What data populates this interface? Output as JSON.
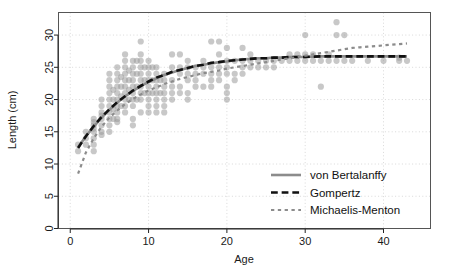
{
  "chart_data": {
    "type": "scatter",
    "title": "",
    "xlabel": "Age",
    "ylabel": "Length (cm)",
    "xlim": [
      -1.5,
      46
    ],
    "ylim": [
      0,
      33.5
    ],
    "xticks": [
      0,
      10,
      20,
      30,
      40
    ],
    "xtick_labels": [
      "0",
      "10",
      "20",
      "30",
      "40"
    ],
    "yticks": [
      0,
      5,
      10,
      15,
      20,
      25,
      30
    ],
    "ytick_labels": [
      "0",
      "5",
      "10",
      "15",
      "20",
      "25",
      "30"
    ],
    "grid": "dotted gridlines at major ticks",
    "legend_position": "bottom-right inside panel",
    "point_color": "#9a9a9a",
    "point_opacity": 0.55,
    "point_radius": 3.1,
    "scatter": {
      "name": "Observed length-at-age",
      "points": [
        [
          1,
          12.0
        ],
        [
          1,
          13.0
        ],
        [
          2,
          13.0
        ],
        [
          2,
          14.0
        ],
        [
          2,
          15.0
        ],
        [
          3,
          14.0
        ],
        [
          3,
          15.0
        ],
        [
          3,
          15.5
        ],
        [
          3,
          16.0
        ],
        [
          3,
          16.5
        ],
        [
          3,
          17.0
        ],
        [
          3,
          12.0
        ],
        [
          3,
          13.0
        ],
        [
          4,
          15.0
        ],
        [
          4,
          16.0
        ],
        [
          4,
          17.0
        ],
        [
          4,
          17.5
        ],
        [
          4,
          18.0
        ],
        [
          4,
          19.0
        ],
        [
          4,
          20.0
        ],
        [
          4,
          14.5
        ],
        [
          5,
          16.0
        ],
        [
          5,
          17.0
        ],
        [
          5,
          18.0
        ],
        [
          5,
          19.0
        ],
        [
          5,
          20.0
        ],
        [
          5,
          21.0
        ],
        [
          5,
          22.0
        ],
        [
          5,
          23.0
        ],
        [
          5,
          24.0
        ],
        [
          5,
          15.0
        ],
        [
          5.5,
          17.0
        ],
        [
          5.5,
          18.5
        ],
        [
          5.5,
          20.0
        ],
        [
          5.5,
          21.5
        ],
        [
          6,
          17.0
        ],
        [
          6,
          18.0
        ],
        [
          6,
          19.0
        ],
        [
          6,
          20.0
        ],
        [
          6,
          21.0
        ],
        [
          6,
          22.0
        ],
        [
          6,
          23.0
        ],
        [
          6,
          24.0
        ],
        [
          6,
          25.0
        ],
        [
          6,
          16.5
        ],
        [
          6.5,
          19.0
        ],
        [
          6.5,
          20.5
        ],
        [
          6.5,
          22.0
        ],
        [
          6.5,
          23.5
        ],
        [
          7,
          18.0
        ],
        [
          7,
          19.0
        ],
        [
          7,
          20.0
        ],
        [
          7,
          21.0
        ],
        [
          7,
          22.0
        ],
        [
          7,
          23.0
        ],
        [
          7,
          24.0
        ],
        [
          7,
          25.0
        ],
        [
          7,
          26.0
        ],
        [
          7,
          27.0
        ],
        [
          7.5,
          20.0
        ],
        [
          7.5,
          21.5
        ],
        [
          7.5,
          23.0
        ],
        [
          7.5,
          24.5
        ],
        [
          8,
          19.0
        ],
        [
          8,
          20.0
        ],
        [
          8,
          21.0
        ],
        [
          8,
          22.0
        ],
        [
          8,
          23.0
        ],
        [
          8,
          24.0
        ],
        [
          8,
          25.0
        ],
        [
          8,
          26.0
        ],
        [
          8,
          16.0
        ],
        [
          8,
          17.0
        ],
        [
          8.5,
          20.0
        ],
        [
          8.5,
          22.0
        ],
        [
          8.5,
          24.0
        ],
        [
          8.5,
          26.0
        ],
        [
          9,
          20.0
        ],
        [
          9,
          21.0
        ],
        [
          9,
          22.0
        ],
        [
          9,
          23.0
        ],
        [
          9,
          24.0
        ],
        [
          9,
          25.0
        ],
        [
          9,
          26.0
        ],
        [
          9,
          27.0
        ],
        [
          9,
          29.0
        ],
        [
          9,
          18.0
        ],
        [
          9.5,
          21.0
        ],
        [
          9.5,
          23.0
        ],
        [
          9.5,
          25.0
        ],
        [
          10,
          20.0
        ],
        [
          10,
          21.0
        ],
        [
          10,
          22.0
        ],
        [
          10,
          23.0
        ],
        [
          10,
          24.0
        ],
        [
          10,
          25.0
        ],
        [
          10,
          26.0
        ],
        [
          10,
          19.0
        ],
        [
          10,
          18.0
        ],
        [
          10.5,
          21.0
        ],
        [
          10.5,
          23.0
        ],
        [
          10.5,
          25.0
        ],
        [
          11,
          20.0
        ],
        [
          11,
          21.0
        ],
        [
          11,
          22.0
        ],
        [
          11,
          23.0
        ],
        [
          11,
          24.0
        ],
        [
          11,
          25.0
        ],
        [
          11,
          19.0
        ],
        [
          11,
          18.0
        ],
        [
          11.5,
          21.0
        ],
        [
          11.5,
          23.0
        ],
        [
          12,
          20.0
        ],
        [
          12,
          21.0
        ],
        [
          12,
          22.0
        ],
        [
          12,
          23.0
        ],
        [
          12,
          24.0
        ],
        [
          12,
          19.0
        ],
        [
          12,
          18.0
        ],
        [
          13,
          21.0
        ],
        [
          13,
          22.0
        ],
        [
          13,
          23.0
        ],
        [
          13,
          25.0
        ],
        [
          13,
          27.0
        ],
        [
          13,
          20.0
        ],
        [
          14,
          22.0
        ],
        [
          14,
          24.0
        ],
        [
          14,
          25.0
        ],
        [
          14,
          27.0
        ],
        [
          14,
          21.0
        ],
        [
          15,
          20.0
        ],
        [
          15,
          21.0
        ],
        [
          15,
          23.0
        ],
        [
          15,
          24.0
        ],
        [
          15,
          25.0
        ],
        [
          15,
          26.0
        ],
        [
          16,
          22.0
        ],
        [
          16,
          23.0
        ],
        [
          16,
          24.0
        ],
        [
          16,
          25.0
        ],
        [
          17,
          22.0
        ],
        [
          17,
          24.0
        ],
        [
          17,
          25.0
        ],
        [
          17,
          26.0
        ],
        [
          18,
          23.0
        ],
        [
          18,
          24.0
        ],
        [
          18,
          25.0
        ],
        [
          18,
          29.0
        ],
        [
          18,
          22.0
        ],
        [
          19,
          23.0
        ],
        [
          19,
          24.0
        ],
        [
          19,
          25.0
        ],
        [
          19,
          27.0
        ],
        [
          19,
          29.0
        ],
        [
          20,
          20.0
        ],
        [
          20,
          21.0
        ],
        [
          20,
          22.0
        ],
        [
          20,
          24.0
        ],
        [
          20,
          25.0
        ],
        [
          20,
          26.0
        ],
        [
          20,
          28.0
        ],
        [
          21,
          23.0
        ],
        [
          21,
          24.0
        ],
        [
          21,
          26.0
        ],
        [
          22,
          24.0
        ],
        [
          22,
          25.0
        ],
        [
          22,
          26.0
        ],
        [
          22,
          28.0
        ],
        [
          23,
          25.0
        ],
        [
          23,
          26.0
        ],
        [
          23,
          27.0
        ],
        [
          24,
          25.0
        ],
        [
          24,
          26.0
        ],
        [
          25,
          25.0
        ],
        [
          25,
          26.0
        ],
        [
          26,
          25.0
        ],
        [
          26,
          26.0
        ],
        [
          27,
          26.0
        ],
        [
          28,
          26.0
        ],
        [
          28,
          27.0
        ],
        [
          29,
          26.0
        ],
        [
          29,
          27.0
        ],
        [
          30,
          26.0
        ],
        [
          30,
          27.0
        ],
        [
          30,
          30.0
        ],
        [
          31,
          26.0
        ],
        [
          31,
          27.0
        ],
        [
          32,
          22.0
        ],
        [
          32,
          26.0
        ],
        [
          33,
          26.0
        ],
        [
          33,
          27.0
        ],
        [
          34,
          26.0
        ],
        [
          34,
          30.0
        ],
        [
          34,
          32.0
        ],
        [
          35,
          26.0
        ],
        [
          35,
          30.0
        ],
        [
          36,
          26.0
        ],
        [
          38,
          26.0
        ],
        [
          40,
          26.0
        ],
        [
          42,
          26.0
        ],
        [
          42,
          26.5
        ],
        [
          43,
          26.0
        ]
      ]
    },
    "series": [
      {
        "name": "von Bertalanffy",
        "style": "solid",
        "color": "#8c8c8c",
        "width": 2.6,
        "model": "Linf*(1-exp(-K*(t-t0)))",
        "points": [
          [
            1,
            12.6
          ],
          [
            2,
            14.3
          ],
          [
            3,
            15.8
          ],
          [
            4,
            17.2
          ],
          [
            5,
            18.4
          ],
          [
            6,
            19.5
          ],
          [
            7,
            20.5
          ],
          [
            8,
            21.3
          ],
          [
            9,
            22.1
          ],
          [
            10,
            22.7
          ],
          [
            11,
            23.3
          ],
          [
            12,
            23.8
          ],
          [
            13,
            24.2
          ],
          [
            14,
            24.6
          ],
          [
            15,
            24.9
          ],
          [
            16,
            25.2
          ],
          [
            17,
            25.4
          ],
          [
            18,
            25.6
          ],
          [
            19,
            25.8
          ],
          [
            20,
            25.9
          ],
          [
            21,
            26.1
          ],
          [
            22,
            26.2
          ],
          [
            23,
            26.3
          ],
          [
            24,
            26.4
          ],
          [
            25,
            26.4
          ],
          [
            26,
            26.5
          ],
          [
            27,
            26.5
          ],
          [
            28,
            26.6
          ],
          [
            29,
            26.6
          ],
          [
            30,
            26.6
          ],
          [
            32,
            26.7
          ],
          [
            34,
            26.7
          ],
          [
            36,
            26.7
          ],
          [
            38,
            26.7
          ],
          [
            40,
            26.7
          ],
          [
            43,
            26.7
          ]
        ]
      },
      {
        "name": "Gompertz",
        "style": "dashed",
        "color": "#111111",
        "width": 2.6,
        "model": "Linf*exp(-exp(-g*(t-ti)))",
        "points": [
          [
            1,
            12.5
          ],
          [
            2,
            14.3
          ],
          [
            3,
            15.9
          ],
          [
            4,
            17.3
          ],
          [
            5,
            18.5
          ],
          [
            6,
            19.6
          ],
          [
            7,
            20.5
          ],
          [
            8,
            21.4
          ],
          [
            9,
            22.1
          ],
          [
            10,
            22.8
          ],
          [
            11,
            23.4
          ],
          [
            12,
            23.8
          ],
          [
            13,
            24.3
          ],
          [
            14,
            24.6
          ],
          [
            15,
            24.9
          ],
          [
            16,
            25.2
          ],
          [
            17,
            25.4
          ],
          [
            18,
            25.7
          ],
          [
            19,
            25.8
          ],
          [
            20,
            26.0
          ],
          [
            21,
            26.1
          ],
          [
            22,
            26.2
          ],
          [
            23,
            26.3
          ],
          [
            24,
            26.4
          ],
          [
            25,
            26.4
          ],
          [
            26,
            26.5
          ],
          [
            27,
            26.5
          ],
          [
            28,
            26.6
          ],
          [
            29,
            26.6
          ],
          [
            30,
            26.6
          ],
          [
            32,
            26.7
          ],
          [
            34,
            26.7
          ],
          [
            36,
            26.7
          ],
          [
            38,
            26.7
          ],
          [
            40,
            26.7
          ],
          [
            43,
            26.7
          ]
        ]
      },
      {
        "name": "Michaelis-Menton",
        "style": "dotted",
        "color": "#8c8c8c",
        "width": 2.2,
        "model": "Linf*t/(K+t)",
        "points": [
          [
            1,
            8.5
          ],
          [
            2,
            11.8
          ],
          [
            3,
            14.0
          ],
          [
            4,
            15.8
          ],
          [
            5,
            17.2
          ],
          [
            6,
            18.3
          ],
          [
            7,
            19.3
          ],
          [
            8,
            20.1
          ],
          [
            9,
            20.8
          ],
          [
            10,
            21.4
          ],
          [
            11,
            21.9
          ],
          [
            12,
            22.4
          ],
          [
            13,
            22.8
          ],
          [
            14,
            23.2
          ],
          [
            15,
            23.5
          ],
          [
            16,
            23.8
          ],
          [
            17,
            24.1
          ],
          [
            18,
            24.3
          ],
          [
            19,
            24.5
          ],
          [
            20,
            24.8
          ],
          [
            21,
            25.0
          ],
          [
            22,
            25.2
          ],
          [
            23,
            25.4
          ],
          [
            24,
            25.6
          ],
          [
            25,
            25.8
          ],
          [
            26,
            26.0
          ],
          [
            27,
            26.2
          ],
          [
            28,
            26.4
          ],
          [
            29,
            26.6
          ],
          [
            30,
            26.8
          ],
          [
            31,
            27.0
          ],
          [
            32,
            27.2
          ],
          [
            33,
            27.4
          ],
          [
            34,
            27.6
          ],
          [
            35,
            27.8
          ],
          [
            36,
            28.0
          ],
          [
            37,
            28.1
          ],
          [
            38,
            28.2
          ],
          [
            39,
            28.3
          ],
          [
            40,
            28.4
          ],
          [
            41,
            28.5
          ],
          [
            42,
            28.6
          ],
          [
            43,
            28.7
          ]
        ]
      }
    ]
  },
  "legend": {
    "items": [
      {
        "label": "von Bertalanffy"
      },
      {
        "label": "Gompertz"
      },
      {
        "label": "Michaelis-Menton"
      }
    ]
  }
}
